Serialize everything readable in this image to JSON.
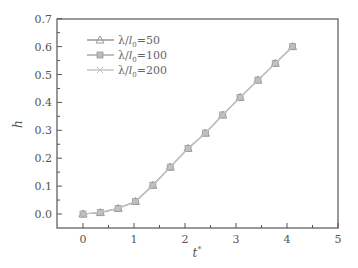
{
  "chart_data": {
    "type": "line",
    "title": "",
    "xlabel": "t*",
    "ylabel": "h",
    "xlim": [
      -0.5,
      5
    ],
    "ylim": [
      -0.05,
      0.7
    ],
    "xticks": [
      "0",
      "1",
      "2",
      "3",
      "4",
      "5"
    ],
    "yticks": [
      "0.0",
      "0.1",
      "0.2",
      "0.3",
      "0.4",
      "0.5",
      "0.6",
      "0.7"
    ],
    "grid": false,
    "legend_position": "upper left",
    "x": [
      0,
      0.34,
      0.69,
      1.03,
      1.37,
      1.71,
      2.06,
      2.4,
      2.74,
      3.08,
      3.43,
      3.77,
      4.11
    ],
    "series": [
      {
        "name": "λ/l₀=50",
        "marker": "triangle",
        "values": [
          0.0,
          0.005,
          0.02,
          0.045,
          0.103,
          0.168,
          0.235,
          0.29,
          0.355,
          0.418,
          0.48,
          0.54,
          0.6
        ]
      },
      {
        "name": "λ/l₀=100",
        "marker": "circle",
        "values": [
          0.0,
          0.005,
          0.02,
          0.045,
          0.103,
          0.168,
          0.235,
          0.29,
          0.355,
          0.418,
          0.48,
          0.54,
          0.6
        ]
      },
      {
        "name": "λ/l₀=200",
        "marker": "x",
        "values": [
          0.0,
          0.005,
          0.02,
          0.045,
          0.103,
          0.168,
          0.235,
          0.29,
          0.355,
          0.418,
          0.48,
          0.54,
          0.6
        ]
      }
    ]
  },
  "legend": {
    "items": [
      {
        "prefix": "λ/",
        "var": "l",
        "sub": "0",
        "rest": "=50"
      },
      {
        "prefix": "λ/",
        "var": "l",
        "sub": "0",
        "rest": "=100"
      },
      {
        "prefix": "λ/",
        "var": "l",
        "sub": "0",
        "rest": "=200"
      }
    ]
  },
  "axes": {
    "x_label": "t",
    "x_label_sup": "*",
    "y_label": "h"
  },
  "colors": {
    "axis": "#555555",
    "series_50": "#999999",
    "series_100": "#aaaaaa",
    "series_200": "#c4c4c4"
  }
}
